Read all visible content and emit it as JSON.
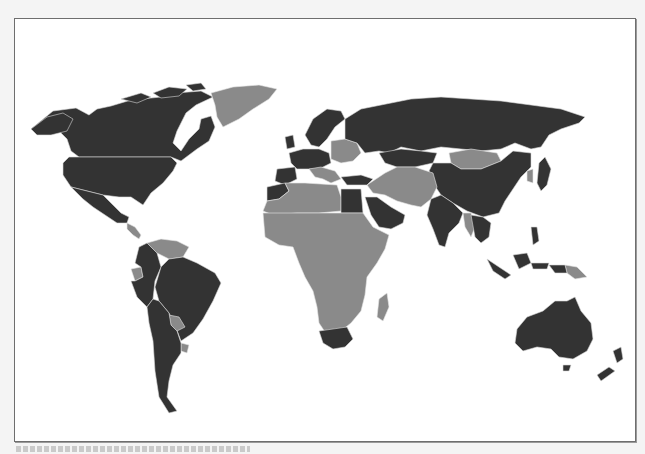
{
  "map": {
    "type": "choropleth",
    "projection": "world",
    "legend": [],
    "colors": {
      "category_a": "#333333",
      "category_b": "#8a8a8a",
      "border": "#e0e0e0",
      "background": "#ffffff",
      "frame": "#6e6e6e"
    },
    "category_a_regions": [
      "United States",
      "Canada",
      "Mexico",
      "Colombia",
      "Peru",
      "Brazil",
      "Bolivia",
      "Chile",
      "Argentina",
      "Western Europe",
      "Northern Europe",
      "Russia",
      "Turkey",
      "China",
      "India",
      "Saudi Arabia",
      "Yemen",
      "Oman",
      "Egypt",
      "Morocco",
      "South Africa",
      "Japan",
      "Thailand",
      "Vietnam",
      "Indonesia",
      "Malaysia",
      "Philippines",
      "Australia",
      "New Zealand",
      "Kazakhstan"
    ],
    "category_b_regions": [
      "Greenland",
      "Central America",
      "Venezuela",
      "Guyana",
      "Suriname",
      "Ecuador",
      "Paraguay",
      "Uruguay",
      "Eastern Europe",
      "Balkans",
      "North Africa (Algeria, Libya)",
      "Sub-Saharan Africa",
      "Madagascar",
      "Iran",
      "Iraq",
      "Syria",
      "Afghanistan",
      "Pakistan",
      "Central Asia",
      "Mongolia",
      "Myanmar",
      "Bangladesh",
      "Korea",
      "Papua New Guinea"
    ]
  },
  "caption": {
    "text_legible": false
  }
}
